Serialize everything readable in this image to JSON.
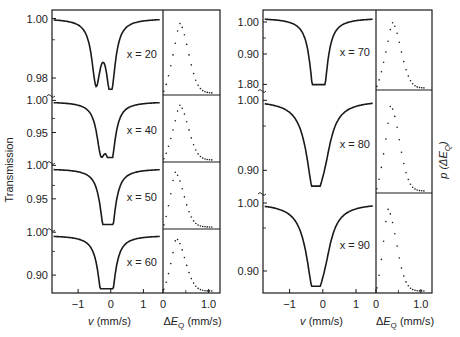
{
  "chart_data": {
    "type": "line",
    "title": "",
    "ylabel_left": "Transmission",
    "ylabel_right": "p (ΔE_Q)",
    "xlabel_spectrum": "v (mm/s)",
    "xlabel_distribution": "ΔE_Q (mm/s)",
    "spectrum_xticks": [
      "−1",
      "0",
      "1"
    ],
    "spectrum_xrange": [
      -1.8,
      1.6
    ],
    "distribution_xticks": [
      "0",
      "1.0"
    ],
    "distribution_xrange": [
      0,
      1.25
    ],
    "panels": [
      {
        "label": "x = 20",
        "column": "left",
        "yticks": [
          "1.00",
          "0.98"
        ],
        "ymin_value": 0.974,
        "dip_positions": [
          -0.45,
          0.0
        ],
        "dip_depths": [
          0.978,
          0.974
        ],
        "dist_peak": 0.35
      },
      {
        "label": "x = 40",
        "column": "left",
        "yticks": [
          "1.00",
          "0.95"
        ],
        "ymin_value": 0.915,
        "dip_positions": [
          -0.3,
          0.0
        ],
        "dip_depths": [
          0.935,
          0.915
        ],
        "dist_peak": 0.35
      },
      {
        "label": "x = 50",
        "column": "left",
        "yticks": [
          "1.00",
          "0.95"
        ],
        "ymin_value": 0.91,
        "dip_positions": [
          -0.2,
          0.0
        ],
        "dip_depths": [
          0.93,
          0.91
        ],
        "dist_peak": 0.25
      },
      {
        "label": "x = 60",
        "column": "left",
        "yticks": [
          "1.00",
          "0.90"
        ],
        "ymin_value": 0.875,
        "dip_positions": [
          -0.25,
          0.0
        ],
        "dip_depths": [
          0.875,
          0.875
        ],
        "dist_peak": 0.28
      },
      {
        "label": "x = 70",
        "column": "right",
        "yticks": [
          "1.00",
          "0.90",
          "1.80"
        ],
        "ymin_value": 0.8,
        "dip_positions": [
          -0.25,
          0.0
        ],
        "dip_depths": [
          0.805,
          0.805
        ],
        "dist_peak": 0.35
      },
      {
        "label": "x = 80",
        "column": "right",
        "yticks": [
          "1.00",
          "0.90"
        ],
        "ymin_value": 0.875,
        "dip_positions": [
          -0.25
        ],
        "dip_depths": [
          0.875
        ],
        "dist_peak": 0.32
      },
      {
        "label": "x = 90",
        "column": "right",
        "yticks": [
          "1.00",
          "0.90"
        ],
        "ymin_value": 0.86,
        "dip_positions": [
          -0.25
        ],
        "dip_depths": [
          0.86
        ],
        "dist_peak": 0.25
      }
    ],
    "grid": false,
    "legend": "none"
  }
}
